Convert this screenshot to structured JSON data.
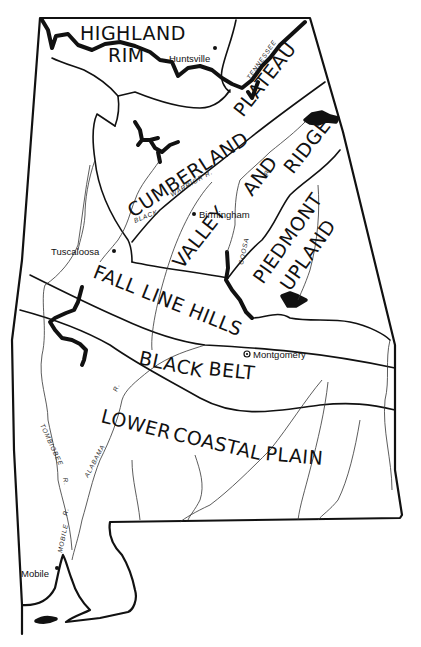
{
  "map": {
    "subject": "Alabama",
    "regions": [
      {
        "id": "highland-rim",
        "lines": [
          "HIGHLAND",
          "RIM"
        ]
      },
      {
        "id": "cumberland-plateau",
        "lines": [
          "CUMBERLAND",
          "PLATEAU"
        ]
      },
      {
        "id": "valley-and-ridge",
        "lines": [
          "VALLEY",
          "AND",
          "RIDGE"
        ]
      },
      {
        "id": "piedmont-upland",
        "lines": [
          "PIEDMONT",
          "UPLAND"
        ]
      },
      {
        "id": "fall-line-hills",
        "lines": [
          "FALL LINE HILLS"
        ]
      },
      {
        "id": "black-belt",
        "lines": [
          "BLACK",
          "BELT"
        ]
      },
      {
        "id": "lower-coastal-plain",
        "lines": [
          "LOWER",
          "COASTAL",
          "PLAIN"
        ]
      }
    ],
    "cities": [
      {
        "name": "Huntsville"
      },
      {
        "name": "Birmingham"
      },
      {
        "name": "Tuscaloosa"
      },
      {
        "name": "Montgomery",
        "capital": true
      },
      {
        "name": "Mobile"
      }
    ],
    "rivers": [
      {
        "name": "TENNESSEE R."
      },
      {
        "name": "BLACK WARRIOR R."
      },
      {
        "name": "COOSA R."
      },
      {
        "name": "TOMBIGBEE R."
      },
      {
        "name": "ALABAMA R."
      },
      {
        "name": "MOBILE R."
      }
    ],
    "river_labels": {
      "tennessee": "TENNESSEE",
      "black": "BLACK",
      "warrior": "WARRIOR R.",
      "coosa": "COOSA",
      "coosa_r": "R.",
      "tombigbee": "TOMBIGBEE",
      "tombigbee_r": "R.",
      "alabama": "ALABAMA",
      "alabama_r": "R.",
      "mobile": "MOBILE",
      "mobile_r": "R."
    },
    "colors": {
      "ink": "#111111",
      "paper": "#ffffff"
    }
  }
}
